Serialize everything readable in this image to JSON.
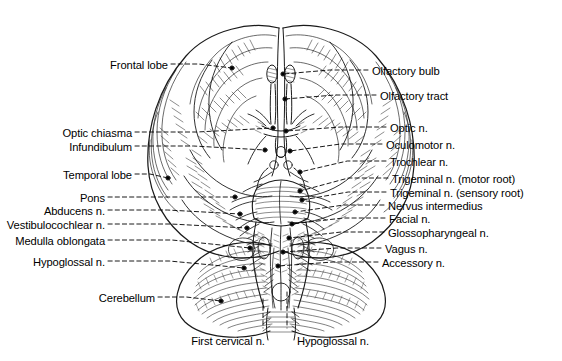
{
  "figure": {
    "view": "inferior-surface",
    "background_color": "#ffffff",
    "ink_color": "#000000",
    "width": 562,
    "height": 361
  },
  "labels_left": [
    {
      "id": "frontal-lobe",
      "text": "Frontal lobe",
      "text_x": 168,
      "text_y": 68,
      "leader_to_x": 232,
      "leader_to_y": 68,
      "marker": "dot"
    },
    {
      "id": "optic-chiasma",
      "text": "Optic chiasma",
      "text_x": 132,
      "text_y": 136,
      "leader_to_x": 273,
      "leader_to_y": 128,
      "marker": "dot"
    },
    {
      "id": "infundibulum",
      "text": "Infundibulum",
      "text_x": 132,
      "text_y": 150,
      "leader_to_x": 265,
      "leader_to_y": 150,
      "marker": "dot"
    },
    {
      "id": "temporal-lobe",
      "text": "Temporal lobe",
      "text_x": 132,
      "text_y": 178,
      "leader_to_x": 168,
      "leader_to_y": 178,
      "marker": "dot"
    },
    {
      "id": "pons",
      "text": "Pons",
      "text_x": 105,
      "text_y": 201,
      "leader_to_x": 235,
      "leader_to_y": 197,
      "marker": "dot"
    },
    {
      "id": "abducens-n",
      "text": "Abducens n.",
      "text_x": 105,
      "text_y": 214,
      "leader_to_x": 240,
      "leader_to_y": 214,
      "marker": "dot"
    },
    {
      "id": "vestibulocochlear-n",
      "text": "Vestibulocochlear n.",
      "text_x": 105,
      "text_y": 228,
      "leader_to_x": 247,
      "leader_to_y": 228,
      "marker": "dot"
    },
    {
      "id": "medulla-oblongata",
      "text": "Medulla oblongata",
      "text_x": 105,
      "text_y": 244,
      "leader_to_x": 250,
      "leader_to_y": 248,
      "marker": "dot"
    },
    {
      "id": "hypoglossal-n-left",
      "text": "Hypoglossal n.",
      "text_x": 105,
      "text_y": 265,
      "leader_to_x": 244,
      "leader_to_y": 268,
      "marker": "dot"
    },
    {
      "id": "cerebellum",
      "text": "Cerebellum",
      "text_x": 155,
      "text_y": 301,
      "leader_to_x": 221,
      "leader_to_y": 301,
      "marker": "dot"
    }
  ],
  "labels_right": [
    {
      "id": "olfactory-bulb",
      "text": "Olfactory bulb",
      "text_x": 372,
      "text_y": 74,
      "leader_to_x": 283,
      "leader_to_y": 74,
      "marker": "dot"
    },
    {
      "id": "olfactory-tract",
      "text": "Olfactory tract",
      "text_x": 380,
      "text_y": 99,
      "leader_to_x": 285,
      "leader_to_y": 99,
      "marker": "dot"
    },
    {
      "id": "optic-n",
      "text": "Optic n.",
      "text_x": 390,
      "text_y": 131,
      "leader_to_x": 286,
      "leader_to_y": 131,
      "marker": "dot"
    },
    {
      "id": "oculomotor-n",
      "text": "Oculomotor n.",
      "text_x": 386,
      "text_y": 148,
      "leader_to_x": 290,
      "leader_to_y": 151,
      "marker": "dot"
    },
    {
      "id": "trochlear-n",
      "text": "Trochlear n.",
      "text_x": 390,
      "text_y": 165,
      "leader_to_x": 300,
      "leader_to_y": 172,
      "marker": "dot"
    },
    {
      "id": "trigeminal-n-motor-root",
      "text": "Trigeminal n. (motor root)",
      "text_x": 392,
      "text_y": 182,
      "leader_to_x": 300,
      "leader_to_y": 191,
      "marker": "dot"
    },
    {
      "id": "trigeminal-n-sensory-root",
      "text": "Trigeminal n. (sensory root)",
      "text_x": 390,
      "text_y": 196,
      "leader_to_x": 302,
      "leader_to_y": 200,
      "marker": "dot"
    },
    {
      "id": "nervus-intermedius",
      "text": "Nervus intermedius",
      "text_x": 388,
      "text_y": 209,
      "leader_to_x": 295,
      "leader_to_y": 212,
      "marker": "dot"
    },
    {
      "id": "facial-n",
      "text": "Facial n.",
      "text_x": 389,
      "text_y": 222,
      "leader_to_x": 292,
      "leader_to_y": 224,
      "marker": "dot"
    },
    {
      "id": "glossopharyngeal-n",
      "text": "Glossopharyngeal n.",
      "text_x": 388,
      "text_y": 236,
      "leader_to_x": 289,
      "leader_to_y": 238,
      "marker": "dot"
    },
    {
      "id": "vagus-n",
      "text": "Vagus n.",
      "text_x": 385,
      "text_y": 252,
      "leader_to_x": 283,
      "leader_to_y": 252,
      "marker": "dot"
    },
    {
      "id": "accessory-n",
      "text": "Accessory n.",
      "text_x": 382,
      "text_y": 266,
      "leader_to_x": 278,
      "leader_to_y": 266,
      "marker": "dot"
    }
  ],
  "labels_bottom": [
    {
      "id": "first-cervical-n",
      "text": "First cervical n.",
      "text_x": 228,
      "text_y": 344,
      "leader_to_x": 263,
      "leader_to_y": 299,
      "marker": "none"
    },
    {
      "id": "hypoglossal-n-bottom",
      "text": "Hypoglossal n.",
      "text_x": 333,
      "text_y": 344,
      "leader_to_x": 287,
      "leader_to_y": 292,
      "marker": "none"
    }
  ]
}
